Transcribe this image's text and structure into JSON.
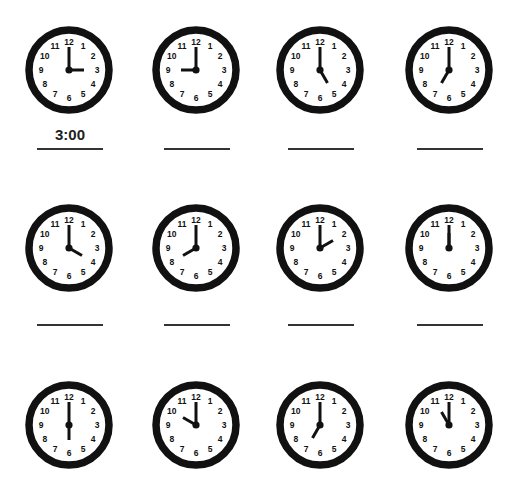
{
  "worksheet": {
    "colors": {
      "ink": "#111111",
      "line": "#333333",
      "face": "#ffffff"
    },
    "clock_numbers": [
      "12",
      "1",
      "2",
      "3",
      "4",
      "5",
      "6",
      "7",
      "8",
      "9",
      "10",
      "11"
    ],
    "rows": [
      {
        "clocks": [
          {
            "time": "3:00",
            "hour": 3,
            "minute": 0,
            "answer": "3:00"
          },
          {
            "time": "9:00",
            "hour": 9,
            "minute": 0,
            "answer": ""
          },
          {
            "time": "5:00",
            "hour": 5,
            "minute": 0,
            "answer": ""
          },
          {
            "time": "7:00",
            "hour": 7,
            "minute": 0,
            "answer": ""
          }
        ],
        "has_answer_lines": true
      },
      {
        "clocks": [
          {
            "time": "4:00",
            "hour": 4,
            "minute": 0,
            "answer": ""
          },
          {
            "time": "8:00",
            "hour": 8,
            "minute": 0,
            "answer": ""
          },
          {
            "time": "2:00",
            "hour": 2,
            "minute": 0,
            "answer": ""
          },
          {
            "time": "12:00",
            "hour": 12,
            "minute": 0,
            "answer": ""
          }
        ],
        "has_answer_lines": true
      },
      {
        "clocks": [
          {
            "time": "6:00",
            "hour": 6,
            "minute": 0,
            "answer": ""
          },
          {
            "time": "10:00",
            "hour": 10,
            "minute": 0,
            "answer": ""
          },
          {
            "time": "7:00",
            "hour": 7,
            "minute": 0,
            "answer": ""
          },
          {
            "time": "11:00",
            "hour": 11,
            "minute": 0,
            "answer": ""
          }
        ],
        "has_answer_lines": false
      }
    ]
  }
}
